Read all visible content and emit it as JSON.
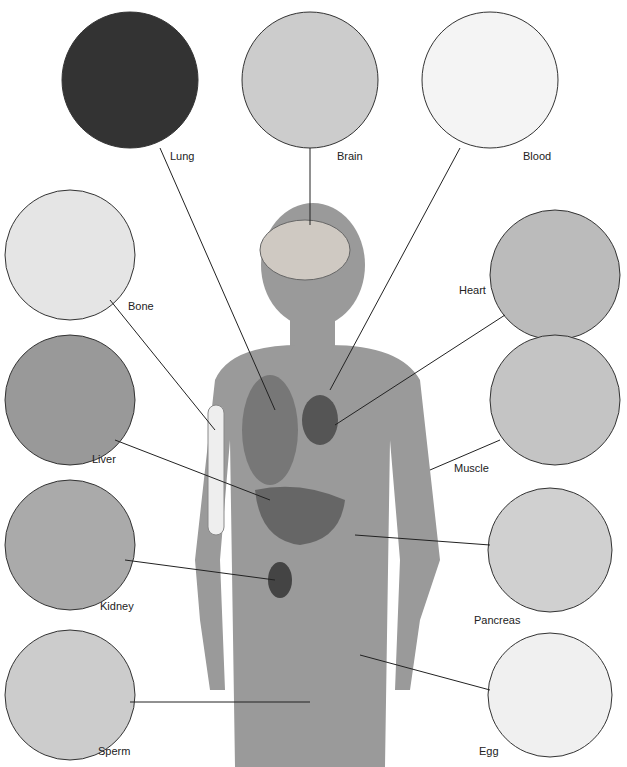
{
  "diagram": {
    "type": "human body cell types",
    "labels": {
      "lung": "Lung",
      "brain": "Brain",
      "blood": "Blood",
      "bone": "Bone",
      "heart": "Heart",
      "liver": "Liver",
      "muscle": "Muscle",
      "kidney": "Kidney",
      "pancreas": "Pancreas",
      "sperm": "Sperm",
      "egg": "Egg"
    }
  }
}
